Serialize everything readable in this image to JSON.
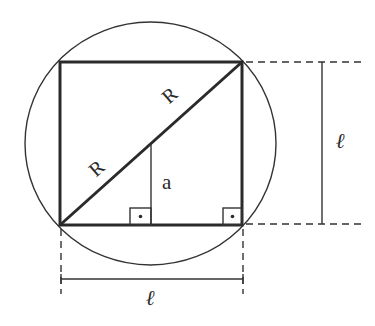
{
  "diagram": {
    "labels": {
      "radius_upper": "R",
      "radius_lower": "R",
      "apothem": "a",
      "side_vertical": "ℓ",
      "side_horizontal": "ℓ"
    },
    "elements": {
      "circle": {
        "cx": 150.5,
        "cy": 143.5,
        "rx": 125.5,
        "ry": 121.5
      },
      "square": {
        "x1": 60,
        "y1": 62,
        "x2": 242,
        "y2": 225
      },
      "diagonal": {
        "from": [
          60,
          225
        ],
        "to": [
          242,
          62
        ]
      },
      "apothem_line": {
        "x": 151,
        "y1": 144,
        "y2": 225
      },
      "right_angle_markers": [
        {
          "x": 130,
          "y": 208,
          "w": 21,
          "h": 17,
          "dot": [
            140.5,
            216.5
          ]
        },
        {
          "x": 223,
          "y": 208,
          "w": 19,
          "h": 17,
          "dot": [
            232.5,
            216.5
          ]
        }
      ],
      "dimension_vertical": {
        "x": 322,
        "y1": 62,
        "y2": 224
      },
      "dimension_horizontal": {
        "y": 279,
        "x1": 61,
        "x2": 243
      }
    },
    "colors": {
      "line": "#2a2a2a",
      "background": "#ffffff"
    }
  }
}
